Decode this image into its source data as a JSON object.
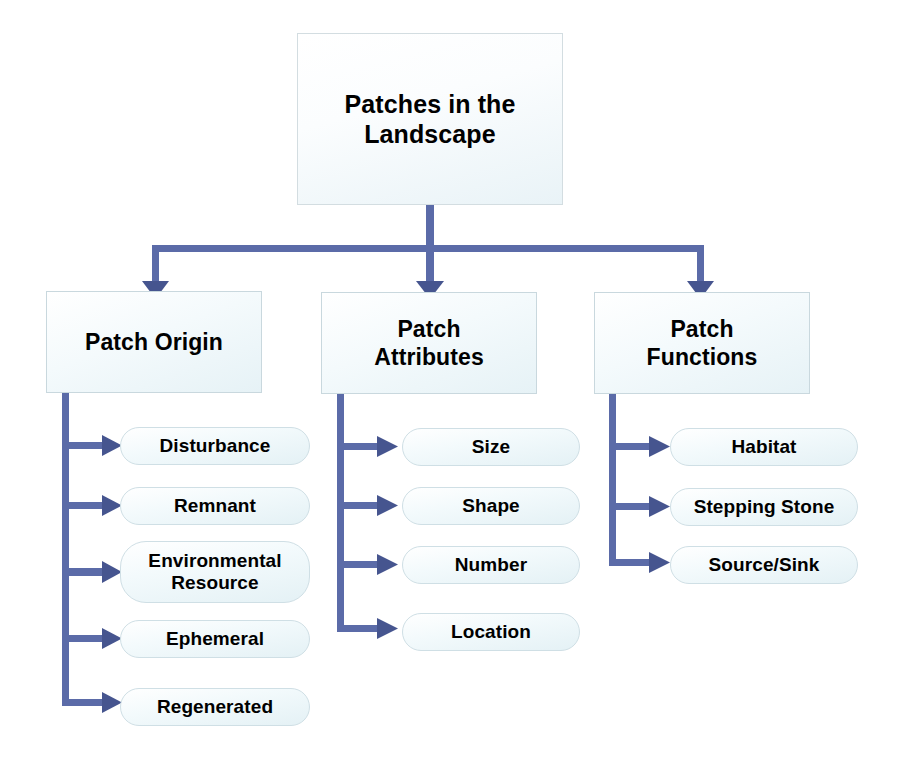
{
  "diagram": {
    "title_node": {
      "label": "Patches in the\nLandscape"
    },
    "branches": [
      {
        "id": "patch-origin",
        "label": "Patch Origin",
        "leaves": [
          {
            "id": "disturbance",
            "label": "Disturbance"
          },
          {
            "id": "remnant",
            "label": "Remnant"
          },
          {
            "id": "environmental-resource",
            "label": "Environmental\nResource"
          },
          {
            "id": "ephemeral",
            "label": "Ephemeral"
          },
          {
            "id": "regenerated",
            "label": "Regenerated"
          }
        ]
      },
      {
        "id": "patch-attributes",
        "label": "Patch\nAttributes",
        "leaves": [
          {
            "id": "size",
            "label": "Size"
          },
          {
            "id": "shape",
            "label": "Shape"
          },
          {
            "id": "number",
            "label": "Number"
          },
          {
            "id": "location",
            "label": "Location"
          }
        ]
      },
      {
        "id": "patch-functions",
        "label": "Patch\nFunctions",
        "leaves": [
          {
            "id": "habitat",
            "label": "Habitat"
          },
          {
            "id": "stepping-stone",
            "label": "Stepping Stone"
          },
          {
            "id": "source-sink",
            "label": "Source/Sink"
          }
        ]
      }
    ],
    "colors": {
      "connector": "#5b6ba8",
      "node_fill_light": "#ffffff",
      "node_fill_tint": "#e6f2f6",
      "node_border": "#c9d8de",
      "text": "#000000",
      "background": "#ffffff"
    }
  }
}
